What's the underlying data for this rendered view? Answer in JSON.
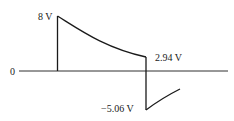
{
  "diagram": {
    "type": "voltage-waveform",
    "axis_origin_label": "0",
    "labels": {
      "peak_start": "8 V",
      "end_of_decay": "2.94 V",
      "negative_peak": "−5.06 V"
    },
    "values": {
      "peak_start_v": 8,
      "end_of_decay_v": 2.94,
      "negative_peak_v": -5.06
    },
    "colors": {
      "line": "#1a1a1a",
      "background": "#ffffff"
    }
  }
}
